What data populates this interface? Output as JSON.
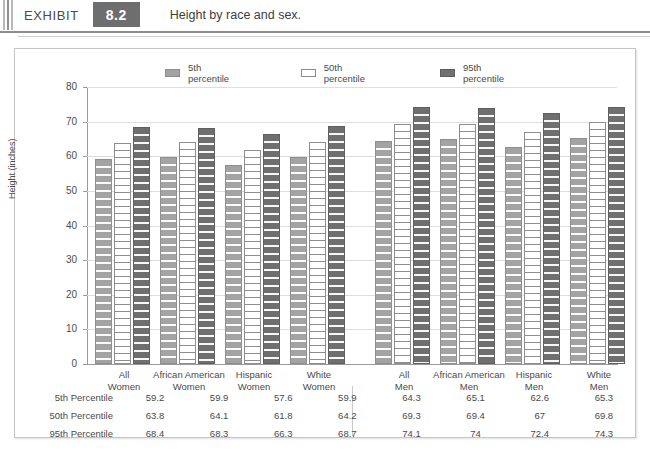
{
  "exhibit": {
    "word": "EXHIBIT",
    "number": "8.2",
    "title": "Height by race and sex."
  },
  "chart_data": {
    "type": "bar",
    "title": "Height by race and sex.",
    "xlabel": "",
    "ylabel": "Height (inches)",
    "ylim": [
      0,
      80
    ],
    "ytick_labels": [
      "0",
      "10",
      "20",
      "30",
      "40",
      "50",
      "60",
      "70",
      "80"
    ],
    "ytick_values": [
      0,
      10,
      20,
      30,
      40,
      50,
      60,
      70,
      80
    ],
    "grid": true,
    "legend_position": "top",
    "categories": [
      "All Women",
      "African American Women",
      "Hispanic Women",
      "White Women",
      "All Men",
      "African American Men",
      "Hispanic Men",
      "White Men"
    ],
    "category_lines": [
      [
        "All",
        "Women"
      ],
      [
        "African American",
        "Women"
      ],
      [
        "Hispanic",
        "Women"
      ],
      [
        "White",
        "Women"
      ],
      [
        "All",
        "Men"
      ],
      [
        "African American",
        "Men"
      ],
      [
        "Hispanic",
        "Men"
      ],
      [
        "White",
        "Men"
      ]
    ],
    "series": [
      {
        "name": "5th percentile",
        "color": "#a3a3a3",
        "values": [
          59.2,
          59.9,
          57.6,
          59.9,
          64.3,
          65.1,
          62.6,
          65.3
        ],
        "labels": [
          "59.2",
          "59.9",
          "57.6",
          "59.9",
          "64.3",
          "65.1",
          "62.6",
          "65.3"
        ]
      },
      {
        "name": "50th percentile",
        "color": "#ffffff",
        "values": [
          63.8,
          64.1,
          61.8,
          64.2,
          69.3,
          69.4,
          67,
          69.8
        ],
        "labels": [
          "63.8",
          "64.1",
          "61.8",
          "64.2",
          "69.3",
          "69.4",
          "67",
          "69.8"
        ]
      },
      {
        "name": "95th percentile",
        "color": "#6f6f6f",
        "values": [
          68.4,
          68.3,
          66.3,
          68.7,
          74.1,
          74,
          72.4,
          74.3
        ],
        "labels": [
          "68.4",
          "68.3",
          "66.3",
          "68.7",
          "74.1",
          "74",
          "72.4",
          "74.3"
        ]
      }
    ]
  },
  "table": {
    "row_headers": [
      "5th Percentile",
      "50th Percentile",
      "95th Percentile"
    ]
  }
}
